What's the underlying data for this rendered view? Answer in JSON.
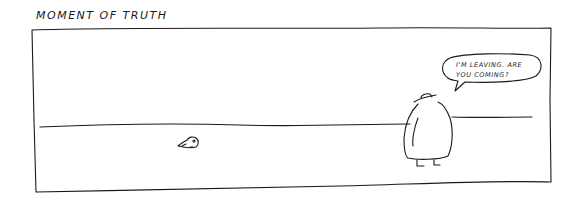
{
  "comic": {
    "title": "MOMENT OF TRUTH",
    "speech_bubble": {
      "line1": "I'M LEAVING. ARE",
      "line2": "YOU COMING?"
    },
    "characters": [
      {
        "name": "small creature",
        "position": "left, on ground"
      },
      {
        "name": "large figure in hat and coat",
        "position": "right, facing away"
      }
    ],
    "colors": {
      "ink": "#1a1a1a",
      "paper": "#ffffff"
    }
  }
}
